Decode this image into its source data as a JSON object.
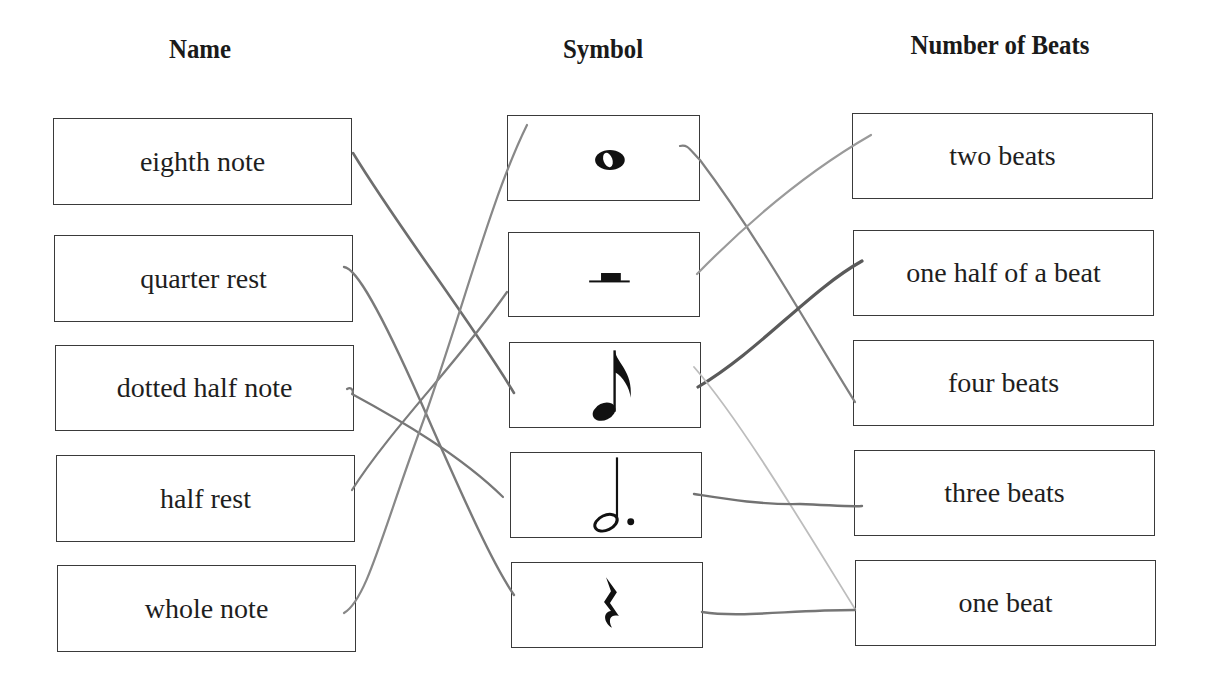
{
  "headings": {
    "name": "Name",
    "symbol": "Symbol",
    "beats": "Number of Beats"
  },
  "names": [
    {
      "label": "eighth note"
    },
    {
      "label": "quarter rest"
    },
    {
      "label": "dotted half note"
    },
    {
      "label": "half rest"
    },
    {
      "label": "whole note"
    }
  ],
  "symbols": [
    {
      "icon": "whole-note-icon"
    },
    {
      "icon": "half-rest-icon"
    },
    {
      "icon": "eighth-note-icon"
    },
    {
      "icon": "dotted-half-note-icon"
    },
    {
      "icon": "quarter-rest-icon"
    }
  ],
  "beats": [
    {
      "label": "two beats"
    },
    {
      "label": "one half of a beat"
    },
    {
      "label": "four beats"
    },
    {
      "label": "three beats"
    },
    {
      "label": "one beat"
    }
  ],
  "matches": [
    {
      "name": "eighth note",
      "symbol": "eighth-note-icon"
    },
    {
      "name": "quarter rest",
      "symbol": "quarter-rest-icon"
    },
    {
      "name": "dotted half note",
      "symbol": "dotted-half-note-icon"
    },
    {
      "name": "half rest",
      "symbol": "half-rest-icon"
    },
    {
      "name": "whole note",
      "symbol": "whole-note-icon"
    },
    {
      "symbol": "whole-note-icon",
      "beats": "four beats"
    },
    {
      "symbol": "half-rest-icon",
      "beats": "two beats"
    },
    {
      "symbol": "eighth-note-icon",
      "beats": "one half of a beat"
    },
    {
      "symbol": "eighth-note-icon",
      "beats": "one beat"
    },
    {
      "symbol": "dotted-half-note-icon",
      "beats": "three beats"
    },
    {
      "symbol": "quarter-rest-icon",
      "beats": "one beat"
    }
  ],
  "colors": {
    "border": "#3a3a3a",
    "text": "#1e1e1e",
    "pencil": "#7a7a7a",
    "pencil_dark": "#5a5a5a",
    "pencil_light": "#b8b8b8"
  }
}
